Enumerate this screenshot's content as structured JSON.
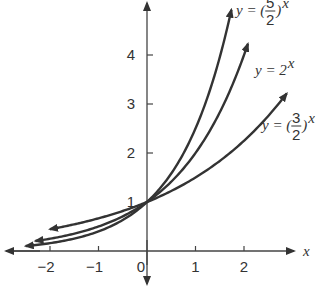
{
  "chart_data": {
    "type": "line",
    "title": "",
    "xlabel": "x",
    "ylabel": "",
    "xlim": [
      -2.6,
      3.0
    ],
    "ylim": [
      -0.3,
      5.0
    ],
    "x_ticks": [
      -2,
      -1,
      0,
      1,
      2
    ],
    "x_tick_labels": [
      "−2",
      "−1",
      "0",
      "1",
      "2"
    ],
    "y_ticks": [
      1,
      2,
      3,
      4
    ],
    "y_tick_labels": [
      "1",
      "2",
      "3",
      "4"
    ],
    "grid": false,
    "series": [
      {
        "name": "y = (5/2)^x",
        "base": 2.5,
        "x_range": [
          -2.5,
          1.74
        ],
        "label": {
          "prefix": "y = (",
          "num": "5",
          "den": "2",
          "suffix": ")",
          "exp": "x"
        }
      },
      {
        "name": "y = 2^x",
        "base": 2.0,
        "x_range": [
          -2.3,
          2.08
        ],
        "label": {
          "prefix": "y = 2",
          "exp": "x"
        }
      },
      {
        "name": "y = (3/2)^x",
        "base": 1.5,
        "x_range": [
          -2.0,
          2.88
        ],
        "label": {
          "prefix": "y = (",
          "num": "3",
          "den": "2",
          "suffix": ")",
          "exp": "x"
        }
      }
    ],
    "colors": {
      "axis": "#444444",
      "curve": "#333333"
    }
  }
}
